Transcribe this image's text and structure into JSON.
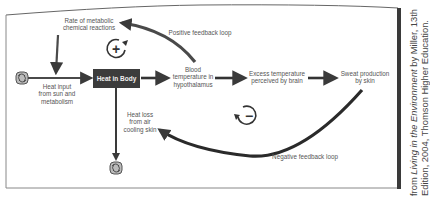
{
  "diagram": {
    "nodes": {
      "metabolic_rate": "Rate of metabolic chemical reactions",
      "heat_input_line1": "Heat input",
      "heat_input_line2": "from sun and",
      "heat_input_line3": "metabolism",
      "heat_in_body": "Heat in Body",
      "blood_temp_line1": "Blood",
      "blood_temp_line2": "temperature in",
      "blood_temp_line3": "hypothalamus",
      "excess_temp_line1": "Excess temperature",
      "excess_temp_line2": "perceived by brain",
      "sweat_line1": "Sweat production",
      "sweat_line2": "by skin",
      "heat_loss_line1": "Heat loss",
      "heat_loss_line2": "from air",
      "heat_loss_line3": "cooling skin",
      "metabolic_line1": "Rate of metabolic",
      "metabolic_line2": "chemical reactions"
    },
    "loops": {
      "positive_label": "Positive feedback loop",
      "positive_symbol": "+",
      "negative_label": "Negative feedback loop",
      "negative_symbol": "−"
    },
    "credit": {
      "prefix": "from ",
      "title": "Living in the Environment",
      "suffix": " by Miller, 13th",
      "line2": "Edition, 2004, Thomson Higher Education."
    },
    "icons": {
      "source": "sink-source-icon",
      "sink": "sink-source-icon"
    }
  }
}
